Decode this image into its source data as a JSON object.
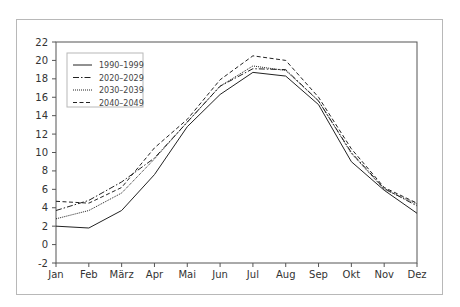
{
  "chart_data": {
    "type": "line",
    "title": "",
    "xlabel": "",
    "ylabel": "",
    "categories": [
      "Jan",
      "Feb",
      "März",
      "Apr",
      "Mai",
      "Jun",
      "Jul",
      "Aug",
      "Sep",
      "Okt",
      "Nov",
      "Dez"
    ],
    "ylim": [
      -2,
      22
    ],
    "yticks": [
      -2,
      0,
      2,
      4,
      6,
      8,
      10,
      12,
      14,
      16,
      18,
      20,
      22
    ],
    "grid": false,
    "legend_position": "upper left",
    "series": [
      {
        "name": "1990–1999",
        "style": "solid",
        "values": [
          2.0,
          1.8,
          3.7,
          7.6,
          12.8,
          16.3,
          18.7,
          18.3,
          15.2,
          9.0,
          5.9,
          3.4
        ]
      },
      {
        "name": "2020–2029",
        "style": "dashdot",
        "values": [
          3.7,
          4.8,
          6.8,
          9.4,
          13.3,
          17.2,
          19.1,
          19.0,
          15.6,
          10.0,
          6.1,
          4.2
        ]
      },
      {
        "name": "2030–2039",
        "style": "dotted",
        "values": [
          2.8,
          3.7,
          5.6,
          9.3,
          13.3,
          17.2,
          19.4,
          18.9,
          15.6,
          9.9,
          6.0,
          4.4
        ]
      },
      {
        "name": "2040–2049",
        "style": "dashed",
        "values": [
          4.7,
          4.5,
          6.2,
          10.5,
          13.6,
          17.9,
          20.5,
          20.0,
          16.0,
          10.4,
          6.2,
          4.5
        ]
      }
    ]
  },
  "legend": {
    "items": [
      "1990–1999",
      "2020–2029",
      "2030–2039",
      "2040–2049"
    ]
  }
}
